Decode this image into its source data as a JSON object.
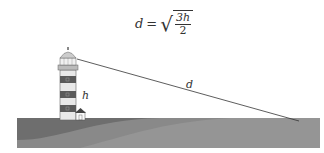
{
  "formula": {
    "lhs": "d",
    "equals": "=",
    "radical": "√",
    "numerator": "3h",
    "denominator": "2"
  },
  "labels": {
    "height": "h",
    "distance": "d"
  },
  "colors": {
    "ground": "#707070",
    "sea": "#8c8c8c",
    "stripe_dark": "#5a5a5a",
    "stripe_light": "#e8e8e8",
    "line": "#333333"
  }
}
